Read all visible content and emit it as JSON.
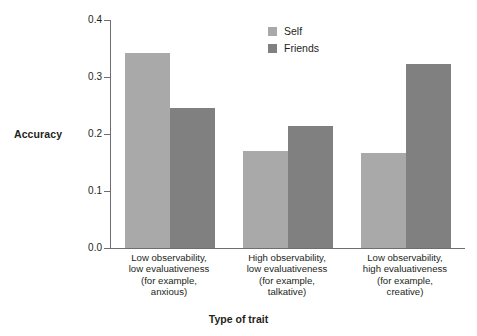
{
  "chart_data": {
    "type": "bar",
    "title": "",
    "xlabel": "Type of trait",
    "ylabel": "Accuracy",
    "ylim": [
      0.0,
      0.4
    ],
    "ytick_labels": [
      "0.0",
      "0.1",
      "0.2",
      "0.3",
      "0.4"
    ],
    "ytick_values": [
      0.0,
      0.1,
      0.2,
      0.3,
      0.4
    ],
    "grid": false,
    "legend_position": "top-right",
    "categories": [
      "Low observability, low evaluativeness (for example, anxious)",
      "High observability, low evaluativeness (for example, talkative)",
      "Low observability, high evaluativeness (for example, creative)"
    ],
    "category_lines": [
      [
        "Low observability,",
        "low evaluativeness",
        "(for example,",
        "anxious)"
      ],
      [
        "High observability,",
        "low evaluativeness",
        "(for example,",
        "talkative)"
      ],
      [
        "Low observability,",
        "high evaluativeness",
        "(for example,",
        "creative)"
      ]
    ],
    "series": [
      {
        "name": "Self",
        "color": "#a9a9a9",
        "values": [
          0.343,
          0.17,
          0.167
        ]
      },
      {
        "name": "Friends",
        "color": "#808080",
        "values": [
          0.246,
          0.214,
          0.322
        ]
      }
    ]
  },
  "axis": {
    "y_title": "Accuracy",
    "x_title": "Type of trait"
  },
  "legend": {
    "items": [
      {
        "label": "Self",
        "swatch": "legend-swatch-self"
      },
      {
        "label": "Friends",
        "swatch": "legend-swatch-friends"
      }
    ]
  }
}
